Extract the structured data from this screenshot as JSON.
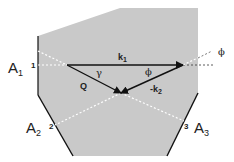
{
  "diagram": {
    "colors": {
      "region_fill": "#c9c9c9",
      "line": "#111111",
      "dashed": "#ffffff",
      "dashed_outside": "#333333",
      "text": "#222222"
    },
    "analyzers": [
      {
        "label": "A",
        "subscript": "1",
        "port": "1"
      },
      {
        "label": "A",
        "subscript": "2",
        "port": "2"
      },
      {
        "label": "A",
        "subscript": "3",
        "port": "3"
      }
    ],
    "vectors": {
      "k1": {
        "label": "k",
        "subscript": "1"
      },
      "Q": {
        "label": "Q"
      },
      "neg_k2": {
        "label": "-k",
        "subscript": "2"
      }
    },
    "angles": {
      "gamma": "γ",
      "phi_inner": "ϕ",
      "phi_outer": "ϕ"
    }
  }
}
